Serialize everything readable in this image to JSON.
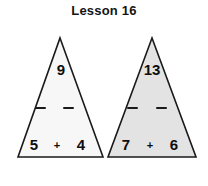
{
  "title": "Lesson 16",
  "background_color": "#ffffff",
  "figure": {
    "type": "fact-family-triangles",
    "outline_color": "#1a1a1a",
    "text_color": "#0d0d0d",
    "triangles": [
      {
        "id": "left",
        "fill_color": "#f7f7f7",
        "top_number": "9",
        "bottom_left_number": "5",
        "bottom_right_number": "4",
        "operator": "+",
        "blank_left": "",
        "blank_right": ""
      },
      {
        "id": "right",
        "fill_color": "#e3e3e3",
        "top_number": "13",
        "bottom_left_number": "7",
        "bottom_right_number": "6",
        "operator": "+",
        "blank_left": "",
        "blank_right": ""
      }
    ]
  }
}
